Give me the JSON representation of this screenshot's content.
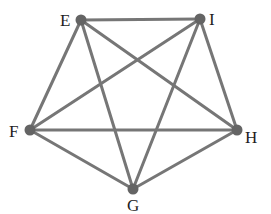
{
  "diagram": {
    "type": "graph",
    "colors": {
      "edge": "#767676",
      "vertex": "#646464",
      "label": "#1e1e1e",
      "background": "#ffffff"
    },
    "vertices": [
      {
        "id": "E",
        "label": "E",
        "x": 81,
        "y": 20,
        "label_x": 60,
        "label_y": 26
      },
      {
        "id": "I",
        "label": "I",
        "x": 200,
        "y": 19,
        "label_x": 209,
        "label_y": 25
      },
      {
        "id": "F",
        "label": "F",
        "x": 30,
        "y": 130,
        "label_x": 9,
        "label_y": 137
      },
      {
        "id": "H",
        "label": "H",
        "x": 237,
        "y": 130,
        "label_x": 245,
        "label_y": 143
      },
      {
        "id": "G",
        "label": "G",
        "x": 133,
        "y": 189,
        "label_x": 127,
        "label_y": 211
      }
    ],
    "edges": [
      {
        "from": "E",
        "to": "I"
      },
      {
        "from": "E",
        "to": "F"
      },
      {
        "from": "E",
        "to": "H"
      },
      {
        "from": "E",
        "to": "G"
      },
      {
        "from": "I",
        "to": "F"
      },
      {
        "from": "I",
        "to": "H"
      },
      {
        "from": "I",
        "to": "G"
      },
      {
        "from": "F",
        "to": "H"
      },
      {
        "from": "F",
        "to": "G"
      },
      {
        "from": "H",
        "to": "G"
      }
    ]
  }
}
